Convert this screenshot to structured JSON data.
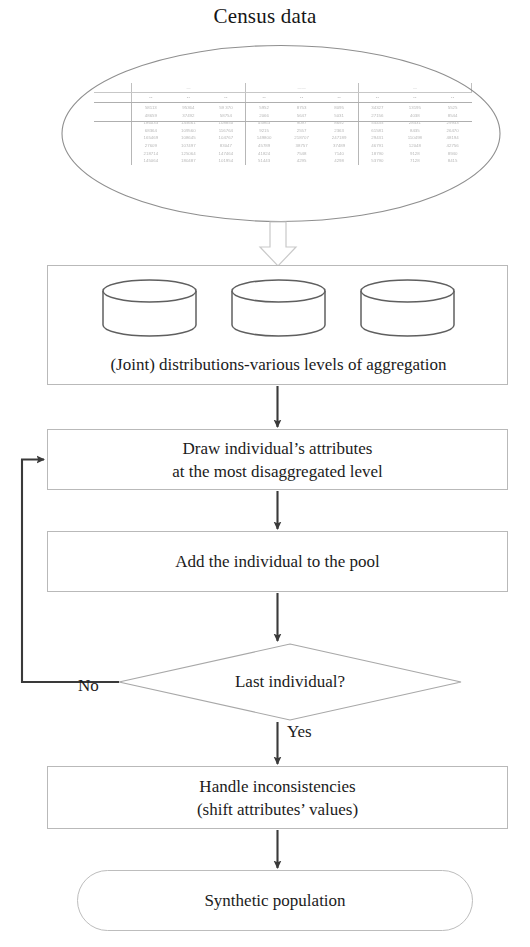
{
  "diagram": {
    "title": "Census data",
    "source": {
      "shape": "ellipse",
      "contents": "scanned census data table"
    },
    "nodes": {
      "distributions": {
        "label": "(Joint) distributions-various levels of aggregation",
        "shape": "process",
        "icons": [
          "database-cylinder-icon",
          "database-cylinder-icon",
          "database-cylinder-icon"
        ]
      },
      "draw": {
        "line1": "Draw individual’s attributes",
        "line2": "at the most disaggregated level",
        "shape": "process"
      },
      "add": {
        "label": "Add the individual to the pool",
        "shape": "process"
      },
      "decision": {
        "label": "Last individual?",
        "shape": "diamond"
      },
      "handle": {
        "line1": "Handle inconsistencies",
        "line2": "(shift attributes’  values)",
        "shape": "process"
      },
      "terminator": {
        "label": "Synthetic population",
        "shape": "rounded-terminator"
      }
    },
    "branches": {
      "no": "No",
      "yes": "Yes"
    },
    "colors": {
      "box_border": "#b9b9b9",
      "connector": "#3a3a3a",
      "text": "#1b1b1b",
      "background": "#ffffff",
      "block_arrow_outline": "#c6c6c6"
    }
  },
  "census_table": {
    "row_labels": [
      "",
      "",
      "",
      "",
      "",
      "",
      ""
    ],
    "group_headers": [
      "",
      "",
      ""
    ],
    "column_headers": [
      "",
      "",
      "",
      "",
      "",
      "",
      "",
      "",
      ""
    ],
    "rows": [
      [
        "",
        "58113",
        "95364",
        "59 370",
        "5952",
        "8753",
        "8095",
        "34327",
        "13195",
        "5525"
      ],
      [
        "",
        "48659",
        "37492",
        "58754",
        "2066",
        "5647",
        "5031",
        "27156",
        "4038",
        "8544"
      ],
      [
        "",
        "186033",
        "145661",
        "108850",
        "45863",
        "9097",
        "8692",
        "55435",
        "28531",
        "29933"
      ],
      [
        "",
        "68364",
        "109560",
        "116764",
        "9215",
        "2557",
        "2363",
        "61581",
        "8435",
        "26470"
      ],
      [
        "",
        "165469",
        "108645",
        "104767",
        "149800",
        "218707",
        "247189",
        "29431",
        "110498",
        "48194"
      ],
      [
        "",
        "27609",
        "107497",
        "83047",
        "45789",
        "38757",
        "37489",
        "46791",
        "12048",
        "42756"
      ],
      [
        "",
        "218714",
        "125064",
        "147464",
        "41824",
        "7548",
        "7140",
        "18790",
        "9128",
        "8940"
      ],
      [
        "",
        "145064",
        "180487",
        "101954",
        "51443",
        "4295",
        "4298",
        "53790",
        "7128",
        "8415"
      ]
    ]
  }
}
